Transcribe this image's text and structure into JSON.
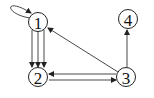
{
  "diagram": {
    "type": "directed-graph",
    "nodes": [
      {
        "id": "1",
        "label": "1",
        "x": 38,
        "y": 22
      },
      {
        "id": "2",
        "label": "2",
        "x": 38,
        "y": 77
      },
      {
        "id": "3",
        "label": "3",
        "x": 126,
        "y": 77
      },
      {
        "id": "4",
        "label": "4",
        "x": 128,
        "y": 19
      }
    ],
    "edges": [
      {
        "from": "1",
        "to": "1",
        "kind": "self-loop"
      },
      {
        "from": "1",
        "to": "2",
        "count": 3
      },
      {
        "from": "3",
        "to": "1"
      },
      {
        "from": "2",
        "to": "3"
      },
      {
        "from": "3",
        "to": "2"
      },
      {
        "from": "3",
        "to": "4"
      }
    ],
    "colors": {
      "stroke": "#222222",
      "background": "#ffffff"
    }
  }
}
